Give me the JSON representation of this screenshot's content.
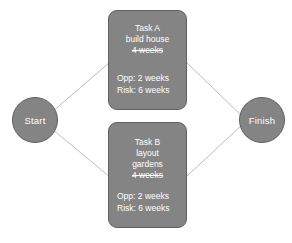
{
  "diagram": {
    "type": "network-flow-diagram",
    "background_color": "#ffffff",
    "node_fill_color": "#848484",
    "node_border_color": "#5f5f5f",
    "node_text_color": "#ffffff",
    "connector_color": "#bdbdbd"
  },
  "nodes": {
    "start": {
      "label": "Start"
    },
    "finish": {
      "label": "Finish"
    },
    "task_a": {
      "title": "Task A",
      "description": "build house",
      "duration": "4 weeks",
      "duration_struck": true,
      "opportunity": "Opp: 2 weeks",
      "risk": "Risk: 6 weeks"
    },
    "task_b": {
      "title": "Task B",
      "description_line1": "layout",
      "description_line2": "gardens",
      "duration": "4 weeks",
      "duration_struck": true,
      "opportunity": "Opp: 2 weeks",
      "risk": "Risk: 6 weeks"
    }
  },
  "connectors": [
    {
      "name": "start-to-task-a",
      "from": "start",
      "to": "task_a"
    },
    {
      "name": "start-to-task-b",
      "from": "start",
      "to": "task_b"
    },
    {
      "name": "task-a-to-finish",
      "from": "task_a",
      "to": "finish"
    },
    {
      "name": "task-b-to-finish",
      "from": "task_b",
      "to": "finish"
    }
  ]
}
